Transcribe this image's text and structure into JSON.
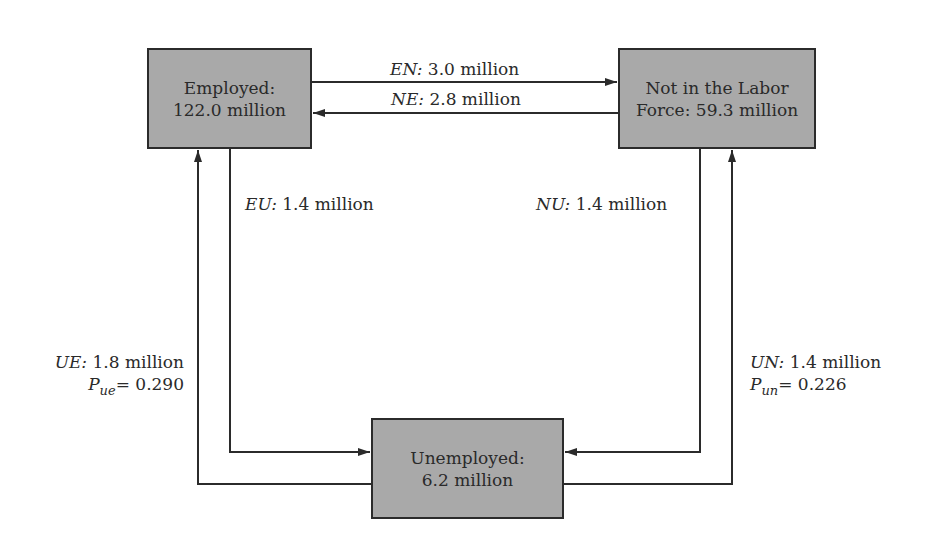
{
  "nodes": {
    "employed": {
      "line1": "Employed:",
      "line2": "122.0 million"
    },
    "nilf": {
      "line1": "Not in the Labor",
      "line2": "Force: 59.3 million"
    },
    "unemployed": {
      "line1": "Unemployed:",
      "line2": "6.2 million"
    }
  },
  "flows": {
    "en": {
      "code": "EN:",
      "value": "3.0 million"
    },
    "ne": {
      "code": "NE:",
      "value": "2.8 million"
    },
    "eu": {
      "code": "EU:",
      "value": "1.4 million"
    },
    "nu": {
      "code": "NU:",
      "value": "1.4 million"
    },
    "ue": {
      "code": "UE:",
      "value": "1.8 million",
      "prob_symbol": "P",
      "prob_sub": "ue",
      "prob_value": "= 0.290"
    },
    "un": {
      "code": "UN:",
      "value": "1.4 million",
      "prob_symbol": "P",
      "prob_sub": "un",
      "prob_value": "= 0.226"
    }
  },
  "colors": {
    "box_fill": "#a9a9a9",
    "line": "#2b2b2b"
  }
}
